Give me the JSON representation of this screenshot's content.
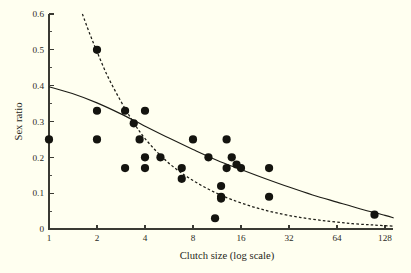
{
  "figure": {
    "background_color": "#fffff0",
    "ink_color": "#1d1d17"
  },
  "chart_data": {
    "type": "scatter",
    "title": "",
    "subtitle": "",
    "xlabel": "Clutch size (log scale)",
    "ylabel": "Sex ratio",
    "grid": false,
    "legend": "none",
    "x_scale": "log2",
    "xlim": [
      1,
      128
    ],
    "ylim": [
      0,
      0.6
    ],
    "x_tick_labels": [
      "1",
      "2",
      "4",
      "8",
      "16",
      "32",
      "64",
      "128"
    ],
    "x_tick_values": [
      1,
      2,
      4,
      8,
      16,
      32,
      64,
      128
    ],
    "y_tick_labels": [
      "0",
      "0.1",
      "0.2",
      "0.3",
      "0.4",
      "0.5",
      "0.6"
    ],
    "y_tick_values": [
      0,
      0.1,
      0.2,
      0.3,
      0.4,
      0.5,
      0.6
    ],
    "y_minor_tick_values": [
      0.05,
      0.15,
      0.25,
      0.35,
      0.45,
      0.55
    ],
    "points": [
      {
        "x": 1,
        "y": 0.25
      },
      {
        "x": 2,
        "y": 0.5
      },
      {
        "x": 2,
        "y": 0.33
      },
      {
        "x": 2,
        "y": 0.25
      },
      {
        "x": 3,
        "y": 0.33
      },
      {
        "x": 3,
        "y": 0.17
      },
      {
        "x": 3.4,
        "y": 0.295
      },
      {
        "x": 3.7,
        "y": 0.25
      },
      {
        "x": 4,
        "y": 0.33
      },
      {
        "x": 4,
        "y": 0.2
      },
      {
        "x": 4,
        "y": 0.17
      },
      {
        "x": 5,
        "y": 0.2
      },
      {
        "x": 6.8,
        "y": 0.17
      },
      {
        "x": 6.8,
        "y": 0.14
      },
      {
        "x": 8,
        "y": 0.25
      },
      {
        "x": 10,
        "y": 0.2
      },
      {
        "x": 11,
        "y": 0.03
      },
      {
        "x": 12,
        "y": 0.12
      },
      {
        "x": 12,
        "y": 0.09
      },
      {
        "x": 12,
        "y": 0.085
      },
      {
        "x": 13,
        "y": 0.25
      },
      {
        "x": 13,
        "y": 0.17
      },
      {
        "x": 14,
        "y": 0.2
      },
      {
        "x": 15,
        "y": 0.18
      },
      {
        "x": 16,
        "y": 0.17
      },
      {
        "x": 24,
        "y": 0.17
      },
      {
        "x": 24,
        "y": 0.09
      },
      {
        "x": 110,
        "y": 0.04
      }
    ],
    "series": [
      {
        "name": "solid-fit-curve",
        "style": "solid",
        "curve": [
          {
            "x": 1,
            "y": 0.397
          },
          {
            "x": 1.4,
            "y": 0.378
          },
          {
            "x": 2,
            "y": 0.352
          },
          {
            "x": 2.8,
            "y": 0.322
          },
          {
            "x": 4,
            "y": 0.287
          },
          {
            "x": 5.7,
            "y": 0.253
          },
          {
            "x": 8,
            "y": 0.222
          },
          {
            "x": 11.3,
            "y": 0.192
          },
          {
            "x": 16,
            "y": 0.166
          },
          {
            "x": 22.6,
            "y": 0.141
          },
          {
            "x": 32,
            "y": 0.117
          },
          {
            "x": 45,
            "y": 0.095
          },
          {
            "x": 64,
            "y": 0.075
          },
          {
            "x": 90,
            "y": 0.056
          },
          {
            "x": 128,
            "y": 0.038
          },
          {
            "x": 145,
            "y": 0.031
          }
        ]
      },
      {
        "name": "dashed-fit-curve",
        "style": "dashed",
        "curve": [
          {
            "x": 1.62,
            "y": 0.6
          },
          {
            "x": 1.8,
            "y": 0.545
          },
          {
            "x": 2,
            "y": 0.495
          },
          {
            "x": 2.3,
            "y": 0.432
          },
          {
            "x": 2.7,
            "y": 0.372
          },
          {
            "x": 3.2,
            "y": 0.315
          },
          {
            "x": 3.8,
            "y": 0.265
          },
          {
            "x": 4.6,
            "y": 0.222
          },
          {
            "x": 5.6,
            "y": 0.185
          },
          {
            "x": 6.9,
            "y": 0.154
          },
          {
            "x": 8.6,
            "y": 0.127
          },
          {
            "x": 11,
            "y": 0.102
          },
          {
            "x": 14,
            "y": 0.082
          },
          {
            "x": 19,
            "y": 0.062
          },
          {
            "x": 26,
            "y": 0.046
          },
          {
            "x": 38,
            "y": 0.032
          },
          {
            "x": 56,
            "y": 0.022
          },
          {
            "x": 80,
            "y": 0.015
          },
          {
            "x": 110,
            "y": 0.011
          },
          {
            "x": 145,
            "y": 0.008
          }
        ]
      }
    ]
  },
  "geometry": {
    "plot_left": 49,
    "plot_right": 385,
    "plot_bottom": 229,
    "plot_top": 14,
    "axis_overrun_right": 8,
    "point_radius": 4.1,
    "tick_major_len": 4.5,
    "tick_minor_len": 2.6
  }
}
